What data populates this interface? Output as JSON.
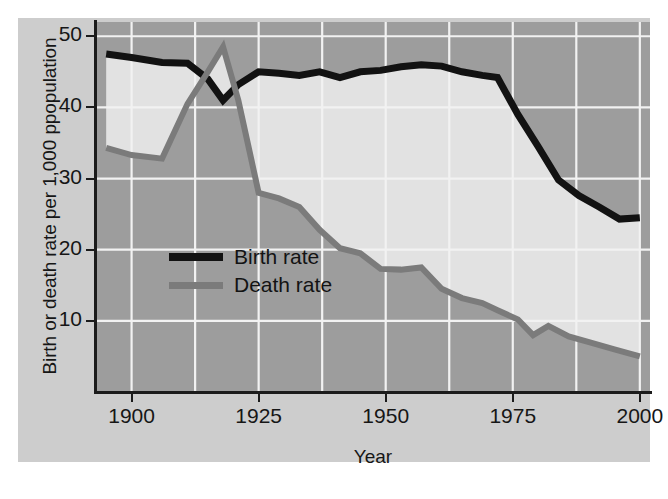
{
  "chart_data": {
    "type": "line",
    "title": "",
    "xlabel": "Year",
    "ylabel": "Birth or death rate per 1,000 ppopulation",
    "xlim": [
      1893,
      2002
    ],
    "ylim": [
      0,
      52
    ],
    "xticks": [
      "1900",
      "1925",
      "1950",
      "1975",
      "2000"
    ],
    "xtick_values": [
      1900,
      1925,
      1950,
      1975,
      2000
    ],
    "yticks": [
      "10",
      "20",
      "30",
      "40",
      "50"
    ],
    "ytick_values": [
      10,
      20,
      30,
      40,
      50
    ],
    "grid": true,
    "legend_position": "center-left-inside",
    "series": [
      {
        "name": "Birth rate",
        "color": "#121212",
        "x": [
          1895,
          1900,
          1906,
          1911,
          1915,
          1918,
          1921,
          1925,
          1929,
          1933,
          1937,
          1941,
          1945,
          1949,
          1953,
          1957,
          1961,
          1965,
          1969,
          1972,
          1976,
          1980,
          1984,
          1988,
          1992,
          1996,
          2000
        ],
        "values": [
          47.5,
          47.0,
          46.3,
          46.2,
          44.0,
          41.0,
          43.2,
          45.0,
          44.8,
          44.5,
          45.0,
          44.2,
          45.0,
          45.2,
          45.7,
          46.0,
          45.8,
          45.0,
          44.5,
          44.2,
          39.0,
          34.5,
          29.8,
          27.6,
          26.0,
          24.3,
          24.5
        ]
      },
      {
        "name": "Death rate",
        "color": "#7b7b7b",
        "x": [
          1895,
          1900,
          1906,
          1911,
          1915,
          1918,
          1921,
          1925,
          1929,
          1933,
          1937,
          1941,
          1945,
          1949,
          1953,
          1957,
          1961,
          1965,
          1969,
          1972,
          1976,
          1979,
          1982,
          1986,
          1990,
          1995,
          2000
        ],
        "values": [
          34.3,
          33.3,
          32.8,
          40.5,
          45.0,
          48.5,
          41.0,
          28.0,
          27.2,
          26.0,
          22.8,
          20.2,
          19.5,
          17.3,
          17.2,
          17.5,
          14.5,
          13.2,
          12.5,
          11.5,
          10.2,
          8.0,
          9.3,
          7.8,
          7.0,
          6.0,
          5.0
        ]
      }
    ],
    "band_fill_color": "#e2e2e2",
    "plot_background_color": "#9d9d9d",
    "gridline_color": "#f2f2f2"
  },
  "legend": {
    "items": [
      {
        "label": "Birth rate",
        "swatch": "birth"
      },
      {
        "label": "Death rate",
        "swatch": "death"
      }
    ]
  },
  "axes": {
    "x_title": "Year",
    "y_title": "Birth or death rate per 1,000 ppopulation",
    "x_tick_labels": [
      "1900",
      "1925",
      "1950",
      "1975",
      "2000"
    ],
    "y_tick_labels": [
      "50",
      "40",
      "30",
      "20",
      "10"
    ]
  }
}
